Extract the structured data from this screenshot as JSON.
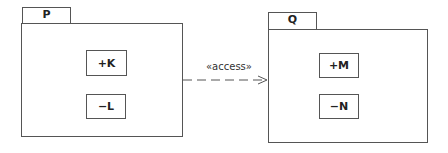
{
  "diagram": {
    "type": "uml-package-diagram",
    "packages": [
      {
        "name": "P",
        "elements": [
          "+K",
          "−L"
        ]
      },
      {
        "name": "Q",
        "elements": [
          "+M",
          "−N"
        ]
      }
    ],
    "dependency": {
      "from": "P",
      "to": "Q",
      "stereotype": "«access»",
      "style": "dashed-open-arrow"
    }
  }
}
